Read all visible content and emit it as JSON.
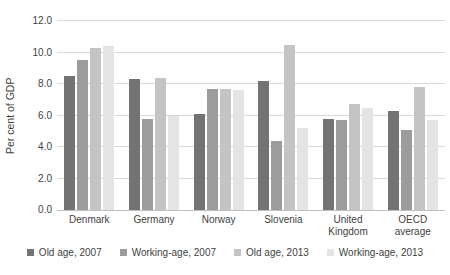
{
  "chart_data": {
    "type": "bar",
    "title": "",
    "ylabel": "Per cent of GDP",
    "xlabel": "",
    "categories": [
      "Denmark",
      "Germany",
      "Norway",
      "Slovenia",
      "United Kingdom",
      "OECD average"
    ],
    "series": [
      {
        "name": "Old age, 2007",
        "color": "#737373",
        "values": [
          8.5,
          8.3,
          6.1,
          8.2,
          5.8,
          6.3
        ]
      },
      {
        "name": "Working-age, 2007",
        "color": "#9c9c9c",
        "values": [
          9.5,
          5.8,
          7.7,
          4.4,
          5.7,
          5.1
        ]
      },
      {
        "name": "Old age, 2013",
        "color": "#c4c4c4",
        "values": [
          10.3,
          8.4,
          7.7,
          10.5,
          6.7,
          7.8
        ]
      },
      {
        "name": "Working-age, 2013",
        "color": "#e4e4e4",
        "values": [
          10.4,
          6.0,
          7.6,
          5.2,
          6.5,
          5.7
        ]
      }
    ],
    "ylim": [
      0,
      12
    ],
    "ytick_step": 2,
    "ytick_labels": [
      "0.0",
      "2.0",
      "4.0",
      "6.0",
      "8.0",
      "10.0",
      "12.0"
    ],
    "grid": true,
    "legend_position": "bottom",
    "colors": {
      "gridline": "#d9d9d9",
      "axis_line": "#bfbfbf",
      "text": "#3f3f3f"
    }
  }
}
